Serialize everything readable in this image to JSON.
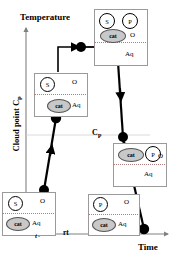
{
  "figure": {
    "type": "schematic-kinetics-diagram",
    "axes": {
      "y_top_label": "Temperature",
      "y_side_label": "Cloud point C",
      "y_side_label_sub": "P",
      "x_label": "Time",
      "x_tick_label": "t",
      "x_region_label": "rt"
    },
    "annotations": [
      {
        "name": "cloud-point-line-label",
        "text": "C",
        "sub": "P"
      }
    ],
    "phase_labels": {
      "organic": "O",
      "aqueous": "Aq"
    },
    "species": {
      "substrate": "S",
      "product": "P",
      "catalyst": "cat"
    },
    "panels": [
      {
        "id": "panel-bottom-left",
        "x": 2,
        "y": 192,
        "w": 52,
        "h": 42,
        "top_circle": "S",
        "top_right": "O",
        "cat": "cat",
        "bottom_right": "Aq",
        "arrow": "none"
      },
      {
        "id": "panel-mid-left",
        "x": 34,
        "y": 73,
        "w": 52,
        "h": 42,
        "top_circle": "S",
        "top_right": "O",
        "cat": "cat",
        "bottom_right": "Aq",
        "arrow": "up"
      },
      {
        "id": "panel-top-right",
        "x": 94,
        "y": 9,
        "w": 52,
        "h": 55,
        "top_circle": "S",
        "second_circle": "P",
        "top_right": "O",
        "cat": "cat",
        "bottom_right": "Aq",
        "arrow": "curve"
      },
      {
        "id": "panel-mid-right",
        "x": 113,
        "y": 143,
        "w": 52,
        "h": 42,
        "top_circle": "P",
        "top_right": "O",
        "cat": "cat",
        "bottom_right": "Aq",
        "arrow": "down"
      },
      {
        "id": "panel-bottom-mid",
        "x": 88,
        "y": 194,
        "w": 50,
        "h": 40,
        "top_circle": "P",
        "top_right": "O",
        "cat": "cat",
        "bottom_right": "Aq",
        "arrow": "none"
      }
    ],
    "nodes": [
      {
        "name": "node-start",
        "cx": 44,
        "cy": 190
      },
      {
        "name": "node-cloud-up",
        "cx": 56,
        "cy": 118
      },
      {
        "name": "node-top-left",
        "cx": 81,
        "cy": 47
      },
      {
        "name": "node-cloud-down",
        "cx": 123,
        "cy": 137
      },
      {
        "name": "node-end",
        "cx": 144,
        "cy": 229
      }
    ],
    "colors": {
      "line": "#000000",
      "catalyst_fill": "#c8c8c8",
      "panel_border": "#9a9a9a",
      "divider": "#b08080",
      "axis": "#808080"
    }
  }
}
